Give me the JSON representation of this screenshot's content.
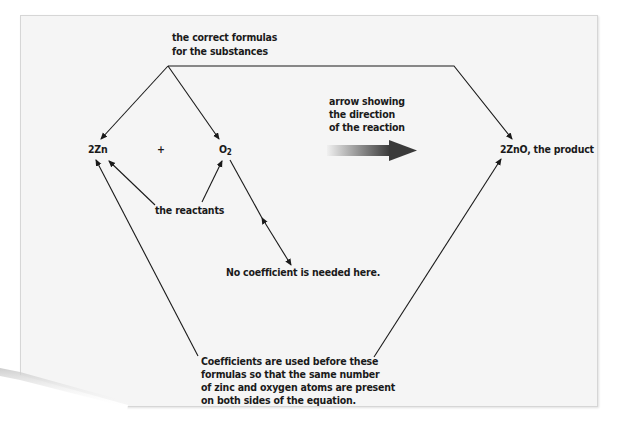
{
  "diagram": {
    "labels": {
      "formulas_line1": "the correct formulas",
      "formulas_line2": "for the substances",
      "arrow_line1": "arrow showing",
      "arrow_line2": "the direction",
      "arrow_line3": "of the reaction",
      "reactants": "the reactants",
      "no_coefficient": "No coefficient is needed here.",
      "coeff_line1": "Coefficients are used before these",
      "coeff_line2": "formulas so that the same number",
      "coeff_line3": "of zinc and oxygen atoms are present",
      "coeff_line4": "on both sides of the equation."
    },
    "equation": {
      "reactant1": "2Zn",
      "plus": "+",
      "reactant2_symbol": "O",
      "reactant2_subscript": "2",
      "product": "2ZnO, the product"
    },
    "colors": {
      "paper": "#f5f5f5",
      "text": "#1a1a1a",
      "line": "#1a1a1a",
      "arrow_dark": "#3a3a3a",
      "arrow_light": "#f0f0f0"
    },
    "icons": {
      "reaction_arrow": "gradient-right-arrow-icon"
    }
  }
}
